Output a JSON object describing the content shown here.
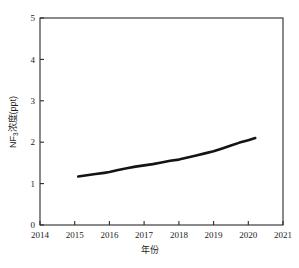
{
  "chart_data": {
    "type": "line",
    "title": "",
    "xlabel": "年份",
    "ylabel": "NF3浓度(ppt)",
    "ylabel_base": "NF",
    "ylabel_sub": "3",
    "ylabel_rest": "浓度(ppt)",
    "xlim": [
      2014,
      2021
    ],
    "ylim": [
      0,
      5
    ],
    "xticks": [
      2014,
      2015,
      2016,
      2017,
      2018,
      2019,
      2020,
      2021
    ],
    "xtick_labels": [
      "2014",
      "2015",
      "2016",
      "2017",
      "2018",
      "2019",
      "2020",
      "2021"
    ],
    "yticks": [
      0,
      1,
      2,
      3,
      4,
      5
    ],
    "ytick_labels": [
      "0",
      "1",
      "2",
      "3",
      "4",
      "5"
    ],
    "grid": false,
    "legend": "none",
    "series": [
      {
        "name": "NF3浓度",
        "color": "#141414",
        "x": [
          2015.1,
          2015.35,
          2015.6,
          2015.85,
          2016.0,
          2016.25,
          2016.5,
          2016.75,
          2017.0,
          2017.25,
          2017.5,
          2017.75,
          2018.0,
          2018.25,
          2018.5,
          2018.75,
          2019.0,
          2019.25,
          2019.5,
          2019.75,
          2020.0,
          2020.2
        ],
        "values": [
          1.17,
          1.2,
          1.23,
          1.26,
          1.28,
          1.33,
          1.37,
          1.41,
          1.44,
          1.47,
          1.51,
          1.55,
          1.58,
          1.63,
          1.68,
          1.73,
          1.78,
          1.85,
          1.92,
          1.99,
          2.05,
          2.1
        ]
      }
    ]
  },
  "figure": {
    "plot_area": {
      "left": 40,
      "top": 18,
      "right": 283,
      "bottom": 225
    }
  }
}
